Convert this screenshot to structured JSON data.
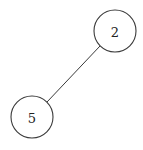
{
  "diagram": {
    "type": "tree",
    "nodes": [
      {
        "id": "n2",
        "label": "2",
        "cx": 115,
        "cy": 31,
        "r": 21
      },
      {
        "id": "n5",
        "label": "5",
        "cx": 32,
        "cy": 117,
        "r": 21
      }
    ],
    "edges": [
      {
        "from": "n2",
        "to": "n5",
        "x1": 100,
        "y1": 46,
        "x2": 47,
        "y2": 102
      }
    ],
    "colors": {
      "stroke": "#3a3a3a",
      "node_fill": "#ffffff",
      "text": "#222222",
      "background": "#ffffff"
    }
  }
}
